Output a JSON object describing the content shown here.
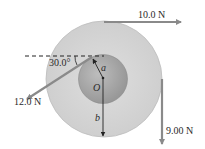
{
  "diagram": {
    "center_label": "O",
    "inner_radius_label": "a",
    "outer_radius_label": "b",
    "angle_label": "30.0°",
    "forces": [
      {
        "label": "10.0 N",
        "direction": "right",
        "point": "top of outer rim"
      },
      {
        "label": "9.00 N",
        "direction": "down",
        "point": "right of outer rim"
      },
      {
        "label": "12.0 N",
        "direction": "down-left at 30.0° below horizontal",
        "point": "top of inner rim"
      }
    ]
  },
  "colors": {
    "outer_disk": "#d6d6d6",
    "inner_disk": "#a9a9a9",
    "arrow": "#8a8a8a",
    "text": "#2a2a2a",
    "line": "#222222"
  }
}
